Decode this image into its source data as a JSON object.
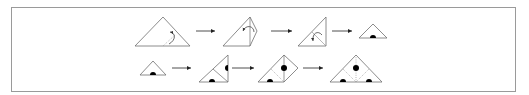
{
  "diagram": {
    "type": "folding-instructions",
    "colors": {
      "line": "#6e6e6e",
      "dot": "#000000",
      "arrow": "#222222",
      "frame": "#9a9a9a"
    },
    "rows": [
      {
        "steps": [
          {
            "id": "r1-s1",
            "shape": "triangle-large",
            "marks": [
              "curved-fold-arrow",
              "dotted-fold-line"
            ]
          },
          {
            "id": "r1-s2",
            "shape": "diamond",
            "marks": [
              "curved-fold-arrow",
              "fold-line"
            ]
          },
          {
            "id": "r1-s3",
            "shape": "right-triangle",
            "marks": [
              "curved-fold-arrow"
            ]
          },
          {
            "id": "r1-s4",
            "shape": "triangle-small",
            "marks": [
              "half-dot"
            ]
          }
        ]
      },
      {
        "steps": [
          {
            "id": "r2-s1",
            "shape": "triangle-small",
            "marks": [
              "half-dot"
            ]
          },
          {
            "id": "r2-s2",
            "shape": "right-triangle",
            "marks": [
              "half-dot-side",
              "half-dot-bottom",
              "fold-line"
            ]
          },
          {
            "id": "r2-s3",
            "shape": "diamond",
            "marks": [
              "dot",
              "half-dot",
              "dotted-fold-lines"
            ]
          },
          {
            "id": "r2-s4",
            "shape": "triangle-large",
            "marks": [
              "dot",
              "half-dot-left",
              "half-dot-right",
              "dotted-fold-lines"
            ]
          }
        ]
      }
    ]
  }
}
